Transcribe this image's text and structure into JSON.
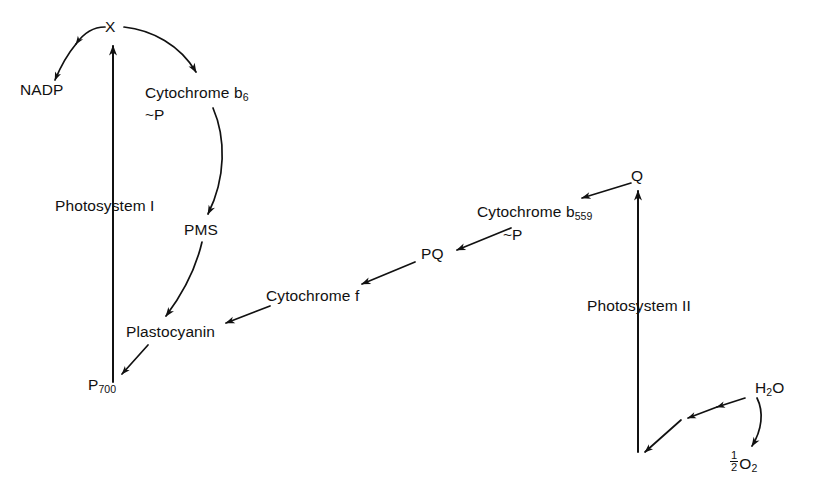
{
  "diagram": {
    "background_color": "#ffffff",
    "stroke_color": "#111111",
    "width": 829,
    "height": 498,
    "nodes": {
      "x": "X",
      "nadp": "NADP",
      "cytochrome_b6": "Cytochrome b",
      "cytochrome_b6_sub": "6",
      "cytochrome_b6_phosphate": "~P",
      "photosystem_i": "Photosystem I",
      "pms": "PMS",
      "plastocyanin": "Plastocyanin",
      "p700": "P",
      "p700_sub": "700",
      "cytochrome_f": "Cytochrome f",
      "pq": "PQ",
      "cytochrome_b559": "Cytochrome b",
      "cytochrome_b559_sub": "559",
      "cytochrome_b559_phosphate": "~P",
      "q": "Q",
      "photosystem_ii": "Photosystem II",
      "water": "H",
      "water_sub": "2",
      "water_o": "O",
      "oxygen_num": "1",
      "oxygen_den": "2",
      "oxygen": "O",
      "oxygen_sub": "2"
    },
    "edges": [
      {
        "name": "x-to-nadp",
        "from": "X",
        "to": "NADP",
        "style": "curved-arrow"
      },
      {
        "name": "x-to-cytochrome-b6",
        "from": "X",
        "to": "Cytochrome b6 ~P",
        "style": "curved-arrow"
      },
      {
        "name": "cytochrome-b6-to-pms",
        "from": "Cytochrome b6 ~P",
        "to": "PMS",
        "style": "curved-arrow"
      },
      {
        "name": "pms-to-plastocyanin",
        "from": "PMS",
        "to": "Plastocyanin",
        "style": "curved-arrow"
      },
      {
        "name": "plastocyanin-to-p700",
        "from": "Plastocyanin",
        "to": "P700",
        "style": "straight-arrow"
      },
      {
        "name": "p700-to-x",
        "from": "P700",
        "to": "X",
        "style": "vertical-arrow"
      },
      {
        "name": "cytochrome-f-to-plastocyanin",
        "from": "Cytochrome f",
        "to": "Plastocyanin",
        "style": "straight-arrow"
      },
      {
        "name": "pq-to-cytochrome-f",
        "from": "PQ",
        "to": "Cytochrome f",
        "style": "straight-arrow"
      },
      {
        "name": "cytochrome-b559-to-pq",
        "from": "Cytochrome b559 ~P",
        "to": "PQ",
        "style": "straight-arrow"
      },
      {
        "name": "q-to-cytochrome-b559",
        "from": "Q",
        "to": "Cytochrome b559 ~P",
        "style": "straight-arrow"
      },
      {
        "name": "photosystem-ii-to-q",
        "from": "Photosystem II",
        "to": "Q",
        "style": "vertical-arrow"
      },
      {
        "name": "water-to-photosystem-ii",
        "from": "H2O",
        "to": "Photosystem II",
        "style": "segmented-arrow"
      },
      {
        "name": "water-to-oxygen",
        "from": "H2O",
        "to": "1/2 O2",
        "style": "curved-arrow"
      }
    ]
  }
}
